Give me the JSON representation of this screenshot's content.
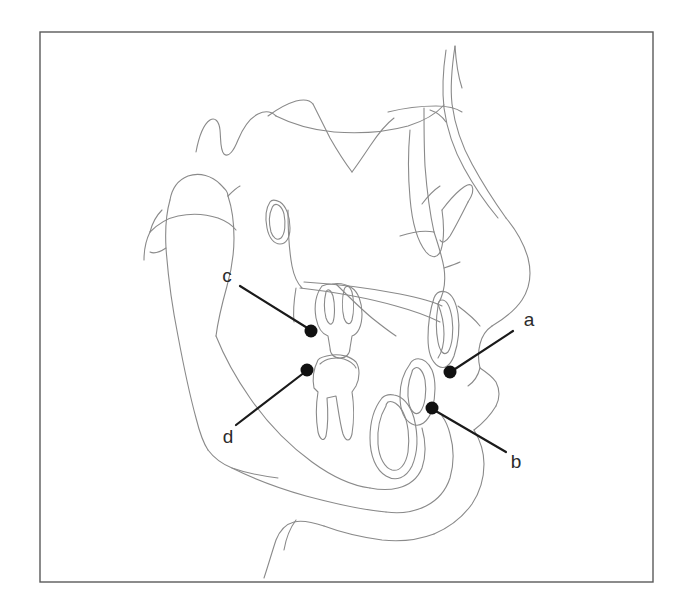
{
  "figure": {
    "background_color": "#ffffff",
    "frame": {
      "x": 40,
      "y": 32,
      "width": 613,
      "height": 550,
      "stroke_color": "#5a5a5a"
    },
    "trace_stroke_color": "#8a8a8a",
    "leader_stroke_color": "#1a1a1a",
    "dot_color": "#111111"
  },
  "labels": [
    {
      "id": "a",
      "text": "a",
      "label_x": 529,
      "label_y": 321,
      "dot_x": 450,
      "dot_y": 372,
      "dot_r": 6.5,
      "leader_x1": 513,
      "leader_y1": 331,
      "leader_x2": 452,
      "leader_y2": 371
    },
    {
      "id": "b",
      "text": "b",
      "label_x": 516,
      "label_y": 463,
      "dot_x": 432,
      "dot_y": 408,
      "dot_r": 6.5,
      "leader_x1": 506,
      "leader_y1": 452,
      "leader_x2": 434,
      "leader_y2": 410
    },
    {
      "id": "c",
      "text": "c",
      "label_x": 227,
      "label_y": 277,
      "dot_x": 311,
      "dot_y": 331,
      "dot_r": 6.5,
      "leader_x1": 240,
      "leader_y1": 286,
      "leader_x2": 309,
      "leader_y2": 329
    },
    {
      "id": "d",
      "text": "d",
      "label_x": 228,
      "label_y": 438,
      "dot_x": 307,
      "dot_y": 370,
      "dot_r": 6.5,
      "leader_x1": 236,
      "leader_y1": 425,
      "leader_x2": 305,
      "leader_y2": 372
    }
  ],
  "paths": {
    "cranial_base_upper": "M196,152 C199,136 204,124 210,120 C215,117 219,121 220,130 C221,140 220,150 224,154 C229,158 234,150 238,140 C243,128 250,118 258,114 C266,110 272,112 276,116",
    "cranial_base_ridge": "M268,116 C276,110 286,104 296,101 C304,99 310,100 313,104",
    "sella_sweep": "M276,116 C292,124 312,130 334,132 C360,134 386,132 408,126 C424,121 436,114 444,105",
    "sphenoid_bar": "M313,104 C318,114 324,126 330,138 C338,152 346,164 352,172",
    "porion_line": "M352,172 C358,164 364,155 370,146 C378,134 386,124 394,118",
    "anterior_cranial": "M388,112 C404,108 420,106 436,106 C448,106 456,108 462,112",
    "orbit_front_edge": "M424,108 C424,126 424,146 425,166 C427,192 430,214 434,232",
    "orbit_rim": "M410,130 C408,152 408,176 410,198 C412,222 418,242 426,252 C432,259 438,258 441,250 C444,240 444,224 442,210",
    "zygo_arch": "M442,210 C448,202 454,195 460,190 C466,185 470,183 472,186 C474,190 472,196 468,202",
    "pterygoid": "M468,202 C462,214 456,226 450,236 C446,242 442,244 440,240",
    "nasal_bridge_skin": "M455,46 C452,66 450,86 452,104 C455,126 462,146 472,164 C484,186 496,204 506,218",
    "nasal_dorsum_bone": "M446,50 C443,70 442,90 444,108 C447,130 454,150 464,168 C476,190 488,206 498,218",
    "glabella_brow": "M455,46 C456,62 458,76 462,88",
    "nose_tip_profile": "M506,218 C516,230 524,244 528,258 C532,274 530,288 522,300 C514,312 502,320 492,326",
    "nasal_ala": "M492,326 C486,330 482,336 480,344 C478,352 478,360 480,368",
    "columella": "M480,368 C478,376 474,382 468,386",
    "upper_lip_soft": "M480,368 C486,372 492,376 496,382 C500,390 500,398 496,406",
    "lip_curve": "M496,406 C490,416 482,424 474,430",
    "nose_under_edge": "M458,306 C466,312 474,318 480,326",
    "brow_to_nasion": "M422,204 C428,196 434,190 440,186",
    "maxilla_front": "M434,232 C438,244 442,256 444,268 C446,282 444,294 438,304",
    "palate_upper": "M304,282 C336,284 370,288 400,294 C420,298 434,302 442,306",
    "palate_lower": "M300,288 C334,292 368,298 396,306 C418,312 432,318 440,322",
    "palate_curve": "M336,284 C348,296 360,308 372,318 C382,326 390,332 396,336",
    "maxilla_tuberosity": "M438,304 C442,314 444,324 444,334 C444,344 442,352 438,358",
    "upper_incisor_outline": "M434,298 C430,310 428,324 428,338 C428,352 432,362 438,366 C444,370 450,366 454,356 C458,344 460,328 458,314 C456,302 452,294 446,292 C440,290 436,293 434,298",
    "upper_incisor_inner": "M438,306 C436,318 436,332 438,342 C440,352 444,356 448,352 C452,346 454,332 452,318 C450,306 446,300 442,300 C440,300 438,302 438,306",
    "upper_molar_outline": "M322,286 C316,294 314,306 316,318 C318,328 322,334 328,336 L330,348 C330,354 334,358 340,358 C346,358 350,354 350,348 L352,336 C358,334 362,326 362,314 C362,302 358,292 352,288 C346,284 338,283 332,284 C328,284 324,285 322,286",
    "upper_molar_root1": "M326,292 C324,300 324,310 326,318 C328,324 331,326 333,322 C335,316 335,304 333,296 C331,290 328,288 326,292",
    "upper_molar_root2": "M344,290 C342,298 342,310 344,318 C346,324 350,326 352,320 C354,312 354,300 352,292 C350,286 346,284 344,290",
    "lower_molar_outline": "M318,360 C314,368 312,378 314,388 L318,392 C316,404 316,420 318,432 C320,440 324,442 326,436 C328,426 328,410 327,398 L336,396 C338,408 340,424 343,434 C346,442 350,442 352,434 C354,422 354,404 352,392 L356,386 C360,378 360,368 356,362 C350,356 340,354 332,355 C325,356 320,357 318,360",
    "lower_molar_cusp": "M320,364 C326,358 336,357 344,359 C350,361 354,364 356,368",
    "lower_incisor_outline": "M410,364 C404,372 400,384 400,396 C400,410 404,420 412,424 C420,428 428,422 432,410 C436,396 436,380 432,370 C428,362 422,358 416,359 C413,360 411,361 410,364",
    "lower_incisor_inner": "M412,372 C408,382 407,394 409,404 C411,412 416,416 420,412 C425,406 427,392 425,380 C423,370 418,366 415,368 C413,369 412,370 412,372",
    "symphysis_tooth": "M382,398 C374,408 370,422 370,438 C370,456 376,470 386,476 C396,482 406,478 412,466 C418,452 418,434 414,418 C410,404 402,396 394,395 C389,394 385,395 382,398",
    "symphysis_inner": "M386,406 C380,416 377,430 378,444 C379,458 385,468 392,470 C400,472 406,464 408,452 C410,438 408,422 403,412 C399,404 392,400 388,402 C387,403 386,404 386,406",
    "mandible_ramus_post": "M170,200 C166,214 165,230 166,248 C168,276 172,306 178,336 C184,368 190,396 196,418 C200,434 204,444 208,450",
    "mandible_ramus_ant": "M228,196 C232,208 234,222 234,238 C234,256 231,272 227,286 C222,304 218,320 216,336",
    "condyle_head": "M170,200 C172,188 178,180 188,176 C200,172 212,176 220,184 C226,190 228,192 228,196",
    "coronoid_slope": "M228,196 C232,192 236,188 240,186",
    "sigmoid_notch": "M150,232 C158,224 168,218 178,216 C192,213 206,214 218,218 C226,221 232,225 236,230",
    "gonial_angle": "M208,450 C214,458 222,464 232,468 C246,473 262,476 278,478",
    "mandible_body_lower": "M232,468 C252,478 278,488 306,496 C336,504 364,510 386,512",
    "mandible_body_upper": "M216,336 C224,356 236,378 250,398 C268,424 290,446 312,462 C334,478 354,486 370,488",
    "symphysis_outline": "M370,488 C380,490 390,490 398,488 C410,485 418,478 422,468 C426,456 426,442 422,428",
    "chin_bone": "M386,512 C400,514 414,512 426,506 C438,500 446,490 450,478 C454,464 454,448 450,434 C448,426 445,420 442,416",
    "soft_tissue_chin": "M474,430 C480,440 484,452 484,464 C484,478 480,492 472,504 C462,518 448,528 434,534",
    "soft_tissue_lower": "M434,534 C418,540 400,542 382,540 C360,537 340,532 324,526",
    "neck_line": "M324,526 C312,522 302,520 294,522 C286,524 280,530 276,540 C272,552 268,566 264,578",
    "hyoid_line": "M296,520 C290,528 286,538 284,550",
    "post_face_line": "M150,232 C146,240 144,250 144,260",
    "ear_canal_mark": "M166,248 C160,252 154,254 150,252",
    "posterior_skull": "M162,210 C156,216 152,224 150,232",
    "pns_line": "M288,210 C288,230 289,250 292,266 C294,276 298,284 302,288",
    "ans_tip": "M444,268 C450,266 456,264 460,262",
    "sella_turcica": "M270,202 C266,208 265,218 267,228 C269,238 274,244 280,244 C286,244 290,238 290,228 C290,216 286,206 280,202 C276,200 272,199 270,202",
    "sella_inner": "M272,208 C269,214 269,224 271,232 C273,238 277,241 281,238 C285,234 286,224 284,214 C282,206 277,203 274,205 C273,206 272,207 272,208",
    "orbital_floor": "M400,236 C412,232 424,230 434,232",
    "maxilla_back": "M296,288 C294,300 293,312 294,322",
    "frontal_sinus": "M430,110 C436,112 442,116 446,122"
  }
}
